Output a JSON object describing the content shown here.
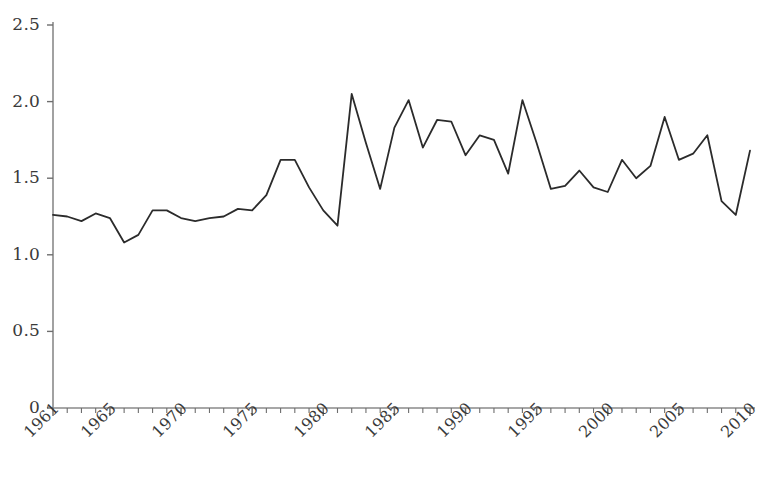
{
  "chart_data": {
    "type": "line",
    "title": "",
    "subtitle": "",
    "xlabel": "",
    "ylabel": "",
    "xlim": [
      1961,
      2010
    ],
    "ylim": [
      0,
      2.5
    ],
    "grid": false,
    "legend_position": "none",
    "y_ticks": [
      0,
      0.5,
      1.0,
      1.5,
      2.0,
      2.5
    ],
    "y_tick_labels": [
      "0",
      "0.5",
      "1.0",
      "1.5",
      "2.0",
      "2.5"
    ],
    "x_ticks": [
      1961,
      1965,
      1970,
      1975,
      1980,
      1985,
      1990,
      1995,
      2000,
      2005,
      2010
    ],
    "x_tick_labels": [
      "1961",
      "1965",
      "1970",
      "1975",
      "1980",
      "1985",
      "1990",
      "1995",
      "2000",
      "2005",
      "2010"
    ],
    "x_minor_tick_interval": 1,
    "x": [
      1961,
      1962,
      1963,
      1964,
      1965,
      1966,
      1967,
      1968,
      1969,
      1970,
      1971,
      1972,
      1973,
      1974,
      1975,
      1976,
      1977,
      1978,
      1979,
      1980,
      1981,
      1982,
      1983,
      1984,
      1985,
      1986,
      1987,
      1988,
      1989,
      1990,
      1991,
      1992,
      1993,
      1994,
      1995,
      1996,
      1997,
      1998,
      1999,
      2000,
      2001,
      2002,
      2003,
      2004,
      2005,
      2006,
      2007,
      2008,
      2009,
      2010
    ],
    "values": [
      1.26,
      1.25,
      1.22,
      1.27,
      1.24,
      1.08,
      1.13,
      1.29,
      1.29,
      1.24,
      1.22,
      1.24,
      1.25,
      1.3,
      1.29,
      1.39,
      1.62,
      1.62,
      1.44,
      1.29,
      1.19,
      2.05,
      1.73,
      1.43,
      1.83,
      2.01,
      1.7,
      1.88,
      1.87,
      1.65,
      1.78,
      1.75,
      1.53,
      2.01,
      1.73,
      1.43,
      1.45,
      1.55,
      1.44,
      1.41,
      1.62,
      1.5,
      1.58,
      1.9,
      1.62,
      1.66,
      1.78,
      1.35,
      1.26,
      1.68
    ],
    "series": [
      {
        "name": "series-1",
        "color": "#2b2b2b",
        "line_width": 1.8,
        "values": [
          1.26,
          1.25,
          1.22,
          1.27,
          1.24,
          1.08,
          1.13,
          1.29,
          1.29,
          1.24,
          1.22,
          1.24,
          1.25,
          1.3,
          1.29,
          1.39,
          1.62,
          1.62,
          1.44,
          1.29,
          1.19,
          2.05,
          1.73,
          1.43,
          1.83,
          2.01,
          1.7,
          1.88,
          1.87,
          1.65,
          1.78,
          1.75,
          1.53,
          2.01,
          1.73,
          1.43,
          1.45,
          1.55,
          1.44,
          1.41,
          1.62,
          1.5,
          1.58,
          1.9,
          1.62,
          1.66,
          1.78,
          1.35,
          1.26,
          1.68
        ]
      }
    ]
  },
  "axes": {
    "axis_color": "#8a8a8a",
    "tick_color": "#6e6e6e",
    "label_color": "#3a3a3a"
  },
  "clipped_top_text": ""
}
